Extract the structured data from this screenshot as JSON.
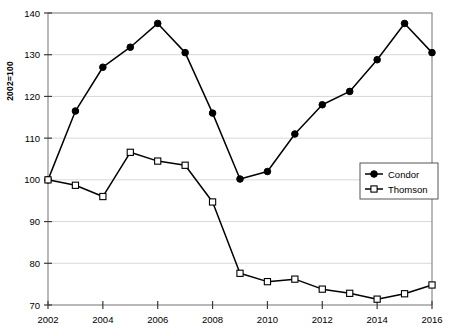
{
  "chart_data": {
    "type": "line",
    "title": "",
    "xlabel": "",
    "ylabel": "2002=100",
    "x": [
      2002,
      2003,
      2004,
      2005,
      2006,
      2007,
      2008,
      2009,
      2010,
      2011,
      2012,
      2013,
      2014,
      2015,
      2016
    ],
    "xlim": [
      2002,
      2016
    ],
    "ylim": [
      70,
      140
    ],
    "xticks": [
      2002,
      2004,
      2006,
      2008,
      2010,
      2012,
      2014,
      2016
    ],
    "xtick_labels": [
      "2002",
      "2004",
      "2006",
      "2008",
      "2010",
      "2012",
      "2014",
      "2016"
    ],
    "yticks": [
      70,
      80,
      90,
      100,
      110,
      120,
      130,
      140
    ],
    "ytick_labels": [
      "70",
      "80",
      "90",
      "100",
      "110",
      "120",
      "130",
      "140"
    ],
    "grid": true,
    "grid_axis": "y",
    "legend_position": "center-right",
    "series": [
      {
        "name": "Condor",
        "marker": "filled-circle",
        "color": "#000000",
        "values": [
          100.0,
          116.5,
          127.0,
          131.8,
          137.5,
          130.5,
          116.0,
          100.2,
          102.0,
          111.0,
          118.0,
          121.2,
          128.8,
          137.5,
          130.5
        ]
      },
      {
        "name": "Thomson",
        "marker": "open-square",
        "color": "#000000",
        "values": [
          100.0,
          98.7,
          96.0,
          106.6,
          104.5,
          103.5,
          94.7,
          77.6,
          75.6,
          76.2,
          73.8,
          72.8,
          71.4,
          72.7,
          74.8
        ]
      }
    ]
  },
  "legend": {
    "entries": [
      {
        "label": "Condor"
      },
      {
        "label": "Thomson"
      }
    ]
  }
}
